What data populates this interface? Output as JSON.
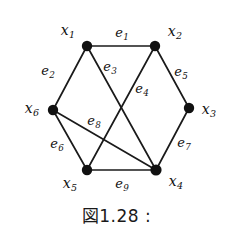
{
  "figure": {
    "caption": "図1.28 :",
    "colors": {
      "background": "#ffffff",
      "edge": "#1a1a1a",
      "node": "#111111",
      "text": "#111111"
    }
  },
  "graph": {
    "vertices": [
      {
        "id": "x1",
        "label": "x",
        "sub": "1",
        "cx": 87,
        "cy": 46,
        "r": 5.2,
        "label_x": 68,
        "label_y": 31
      },
      {
        "id": "x2",
        "label": "x",
        "sub": "2",
        "cx": 155,
        "cy": 46,
        "r": 5.2,
        "label_x": 175,
        "label_y": 32
      },
      {
        "id": "x3",
        "label": "x",
        "sub": "3",
        "cx": 189,
        "cy": 108,
        "r": 5.2,
        "label_x": 209,
        "label_y": 110
      },
      {
        "id": "x4",
        "label": "x",
        "sub": "4",
        "cx": 156,
        "cy": 170,
        "r": 5.6,
        "label_x": 176,
        "label_y": 182
      },
      {
        "id": "x5",
        "label": "x",
        "sub": "5",
        "cx": 87,
        "cy": 170,
        "r": 5.2,
        "label_x": 70,
        "label_y": 184
      },
      {
        "id": "x6",
        "label": "x",
        "sub": "6",
        "cx": 53,
        "cy": 110,
        "r": 5.2,
        "label_x": 32,
        "label_y": 109
      }
    ],
    "edges": [
      {
        "id": "e1",
        "label": "e",
        "sub": "1",
        "from": "x1",
        "to": "x2",
        "label_x": 122,
        "label_y": 34
      },
      {
        "id": "e2",
        "label": "e",
        "sub": "2",
        "from": "x1",
        "to": "x6",
        "label_x": 48,
        "label_y": 72
      },
      {
        "id": "e3",
        "label": "e",
        "sub": "3",
        "from": "x1",
        "to": "x4",
        "label_x": 110,
        "label_y": 68
      },
      {
        "id": "e4",
        "label": "e",
        "sub": "4",
        "from": "x2",
        "to": "x5",
        "label_x": 142,
        "label_y": 90
      },
      {
        "id": "e5",
        "label": "e",
        "sub": "5",
        "from": "x2",
        "to": "x3",
        "label_x": 181,
        "label_y": 73
      },
      {
        "id": "e6",
        "label": "e",
        "sub": "6",
        "from": "x6",
        "to": "x5",
        "label_x": 57,
        "label_y": 145
      },
      {
        "id": "e7",
        "label": "e",
        "sub": "7",
        "from": "x3",
        "to": "x4",
        "label_x": 184,
        "label_y": 144
      },
      {
        "id": "e8",
        "label": "e",
        "sub": "8",
        "from": "x6",
        "to": "x4",
        "label_x": 94,
        "label_y": 122
      },
      {
        "id": "e9",
        "label": "e",
        "sub": "9",
        "from": "x5",
        "to": "x4",
        "label_x": 122,
        "label_y": 185
      }
    ]
  }
}
